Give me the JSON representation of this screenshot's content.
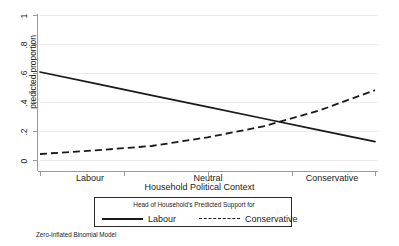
{
  "chart_data": {
    "type": "line",
    "title": "",
    "xlabel": "Household Political Context",
    "ylabel": "predicted proportion",
    "note": "Zero-Inflated Binomial Model",
    "grid": true,
    "ylim": [
      0,
      1
    ],
    "yticks": [
      "0",
      ".2",
      ".4",
      ".6",
      ".8",
      "1"
    ],
    "ytick_values": [
      0,
      0.2,
      0.4,
      0.6,
      0.8,
      1
    ],
    "xtick_labels": [
      "Labour",
      "Neutral",
      "Conservative"
    ],
    "xlim": [
      1,
      7
    ],
    "x": [
      1,
      2,
      3,
      4,
      5,
      6,
      7
    ],
    "legend": {
      "title": "Head of Household's Predicted Support for",
      "position": "below-axis",
      "entries": [
        {
          "label": "Labour",
          "style": "solid"
        },
        {
          "label": "Conservative",
          "style": "dashed"
        }
      ]
    },
    "series": [
      {
        "name": "Labour",
        "style": "solid",
        "color": "#1a1a1a",
        "values": [
          0.61,
          0.53,
          0.45,
          0.37,
          0.29,
          0.21,
          0.13
        ]
      },
      {
        "name": "Conservative",
        "style": "dashed",
        "color": "#1a1a1a",
        "values": [
          0.045,
          0.07,
          0.1,
          0.16,
          0.235,
          0.345,
          0.485
        ]
      }
    ],
    "annotations": [
      {
        "text": "series cross near Neutral-to-Conservative midpoint",
        "x": 4.55,
        "y": 0.27
      }
    ]
  },
  "colors": {
    "line": "#1a1a1a",
    "grid": "#ededed",
    "axis": "#9a9a9a",
    "background": "#ffffff",
    "legend_border": "#2b2b2b"
  }
}
